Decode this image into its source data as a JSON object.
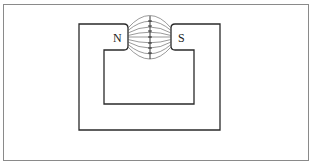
{
  "diagram": {
    "poles": {
      "north_label": "N",
      "south_label": "S"
    },
    "colors": {
      "magnet_outline": "#2a2a2a",
      "field_lines": "#555555",
      "frame_border": "#8a8a8a",
      "background": "#ffffff"
    },
    "field_line_count": 9
  }
}
